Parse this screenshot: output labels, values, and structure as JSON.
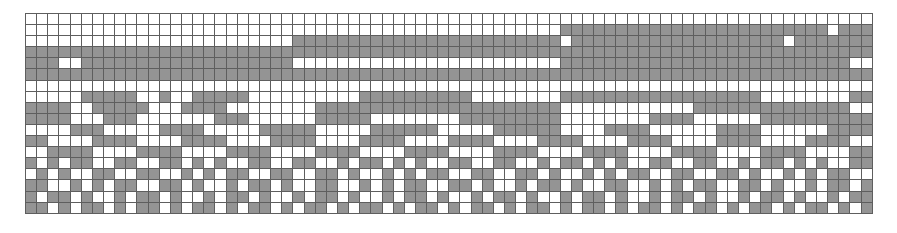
{
  "figure": {
    "name": "binary-grid-pattern",
    "type": "bitmap-grid",
    "columns": 76,
    "rows": 18,
    "cell_size_px": 11.2,
    "origin_px": {
      "x": 25,
      "y": 13
    },
    "extent_px": {
      "x": 872,
      "y": 212
    },
    "colors": {
      "filled_cell": "#949494",
      "empty_cell": "#ffffff",
      "gridline": "#5e5e5e",
      "background": "#ffffff"
    },
    "legend": {
      "filled_label": "filled",
      "empty_label": "empty"
    }
  },
  "chart_data": {
    "type": "heatmap",
    "title": "",
    "xlabel": "",
    "ylabel": "",
    "categories": [],
    "rows": 18,
    "columns": 76,
    "value_map": {
      "0": "empty",
      "1": "filled"
    },
    "matrix": [
      "0000000000000000000000000000000000000000000000000000000000000000000000000000",
      "0000000000000000000000000000000000000000000000001111111111111111111111110111",
      "0000000000000000000000001111111111111111111111110111111111111111111101111111",
      "1111111111111111111111111111111111111111111111111111111111111111111111111111",
      "1110011111111111111111110000000000000000000000001111111111111111111111111100",
      "1111111111111111111111111111111111111111111111111111111111111111111111111111",
      "0000000000000000000000000000000000000000000000000000000000000000000000000000",
      "0000011111001001111100000000001111111111000000001111111111111111110000000011",
      "1111001111100011110000000011111111111111111111110000000000001111111111111100",
      "1111000111000000011100000011111000000001111111110000000011110000001111111111",
      "0000111000001111000001111100000111111000001111110000111100000011110000001111",
      "1100001111000011110000111100001111000011110000111100001111000011110000111100",
      "0011110000111100001111000011110000111100001111000011110000111100001111000011",
      "1010110011001101010011001100101101010011001100101101010011001100101101010011",
      "0101001100110010101100110011010010101100110011010010101100110011010010101100",
      "1100101011001101001011010011001010110011010010110100110010101100110100101101",
      "1011010010110100101101001011010010110100101101001011010010110100101101001011",
      "1101011010110101101011010110101101011010110101101011010110101101011010110101"
    ]
  }
}
